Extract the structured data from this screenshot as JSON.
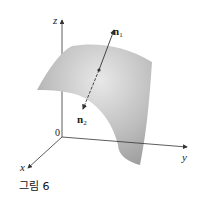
{
  "figure": {
    "caption": "그림 6",
    "axes": {
      "z_label": "z",
      "y_label": "y",
      "x_label": "x",
      "origin_label": "0"
    },
    "vectors": [
      {
        "name": "n",
        "subscript": "1"
      },
      {
        "name": "n",
        "subscript": "2"
      }
    ],
    "colors": {
      "surface_light": "#e6e6e6",
      "surface_dark": "#a9a9a9",
      "axis": "#333333"
    }
  }
}
